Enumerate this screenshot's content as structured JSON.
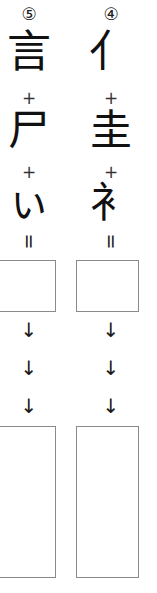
{
  "worksheet": {
    "title": "Kanji component build-up worksheet",
    "columns": [
      {
        "id": "column-5",
        "marker": "⑤",
        "marker_number": "5",
        "components": [
          "言",
          "尸",
          "ぃ"
        ],
        "component_names": [
          "speech-radical-gon",
          "corpse-radical-shi",
          "falling-stroke-hensen"
        ],
        "operators": [
          "+",
          "+"
        ],
        "equals": "=",
        "answer_box": {
          "value": "",
          "shape": "square"
        },
        "arrows": [
          "↓",
          "↓",
          "↓"
        ],
        "result_box": {
          "value": "",
          "shape": "tall-rectangle"
        }
      },
      {
        "id": "column-4",
        "marker": "④",
        "marker_number": "4",
        "components": [
          "亻",
          "圭",
          "衤"
        ],
        "component_names": [
          "person-radical-ninben",
          "earth-double-kei",
          "clothing-bottom-i"
        ],
        "operators": [
          "+",
          "+"
        ],
        "equals": "=",
        "answer_box": {
          "value": "",
          "shape": "square"
        },
        "arrows": [
          "↓",
          "↓",
          "↓"
        ],
        "result_box": {
          "value": "",
          "shape": "tall-rectangle"
        }
      }
    ],
    "colors": {
      "ink": "#1a1a1a",
      "box_border": "#8a8a8a",
      "background": "#ffffff"
    }
  }
}
